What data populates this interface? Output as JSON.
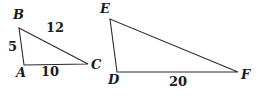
{
  "figure": {
    "background_color": "#ffffff",
    "stroke_color": "#2b2b2b",
    "text_color": "#1a1a1a",
    "stroke_width": 1.1
  },
  "triangles": [
    {
      "name": "triangle-abc",
      "vertices": [
        {
          "label": "B",
          "x": 19,
          "y": 28,
          "label_x": 13,
          "label_y": 8
        },
        {
          "label": "A",
          "x": 24,
          "y": 65,
          "label_x": 16,
          "label_y": 66
        },
        {
          "label": "C",
          "x": 88,
          "y": 64,
          "label_x": 91,
          "label_y": 58
        }
      ],
      "sides": [
        {
          "name": "side-ab",
          "value": "5",
          "label_x": 8,
          "label_y": 40
        },
        {
          "name": "side-bc",
          "value": "12",
          "label_x": 46,
          "label_y": 21
        },
        {
          "name": "side-ac",
          "value": "10",
          "label_x": 41,
          "label_y": 65
        }
      ]
    },
    {
      "name": "triangle-def",
      "vertices": [
        {
          "label": "E",
          "x": 110,
          "y": 19,
          "label_x": 100,
          "label_y": 2
        },
        {
          "label": "D",
          "x": 117,
          "y": 72,
          "label_x": 108,
          "label_y": 73
        },
        {
          "label": "F",
          "x": 238,
          "y": 72,
          "label_x": 241,
          "label_y": 68
        }
      ],
      "sides": [
        {
          "name": "side-df",
          "value": "20",
          "label_x": 169,
          "label_y": 75
        }
      ]
    }
  ]
}
